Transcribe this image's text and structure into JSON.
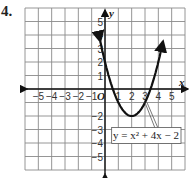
{
  "problem": {
    "number": "4."
  },
  "chart_data": {
    "type": "line",
    "title": "",
    "xlabel": "x",
    "ylabel": "y",
    "origin_label": "O",
    "xlim": [
      -6,
      6
    ],
    "ylim": [
      -6,
      6
    ],
    "grid": true,
    "x_ticks": [
      "-5",
      "-4",
      "-3",
      "-2",
      "-1",
      "1",
      "2",
      "3",
      "4",
      "5"
    ],
    "y_ticks": [
      "5",
      "4",
      "3",
      "2",
      "1",
      "-2",
      "-3",
      "-4",
      "-5"
    ],
    "series": [
      {
        "name": "y = x² + 4x − 2",
        "equation_label": "y = x² + 4x − 2",
        "vertex": [
          2,
          -2
        ],
        "x": [
          -0.6,
          -0.2,
          0,
          0.5,
          1,
          1.5,
          2,
          2.5,
          3,
          3.5,
          4,
          4.6
        ],
        "y": [
          5.8,
          3.2,
          2,
          -0.25,
          -1,
          -1.75,
          -2,
          -1.75,
          -1,
          0.25,
          2,
          5.8
        ]
      }
    ],
    "annotations": [
      {
        "text": "y = x² + 4x − 2",
        "points_to": [
          3,
          -1
        ]
      }
    ]
  }
}
